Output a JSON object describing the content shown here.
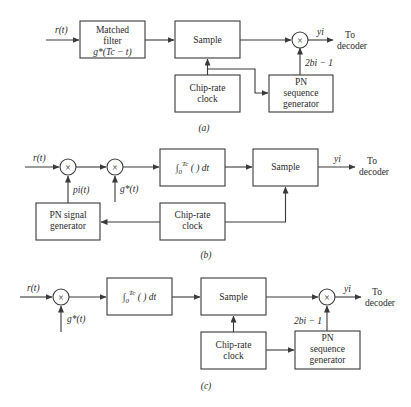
{
  "figure": {
    "panels": [
      {
        "id": "a",
        "caption": "(a)",
        "input_label": "r(t)",
        "matched_filter": {
          "line1": "Matched",
          "line2": "filter",
          "line3": "g*(Tc − t)"
        },
        "sample": "Sample",
        "clock": {
          "line1": "Chip-rate",
          "line2": "clock"
        },
        "pn_seq": {
          "line1": "PN",
          "line2": "sequence",
          "line3": "generator"
        },
        "pn_output_label": "2bi − 1",
        "multiplier_symbol": "×",
        "output_label": "yi",
        "dest": {
          "line1": "To",
          "line2": "decoder"
        }
      },
      {
        "id": "b",
        "caption": "(b)",
        "input_label": "r(t)",
        "multiplier_symbol": "×",
        "pn_signal_label": "pi(t)",
        "g_label": "g*(t)",
        "integrator": "∫₀^Tc ( ) dt",
        "sample": "Sample",
        "pn_signal_gen": {
          "line1": "PN signal",
          "line2": "generator"
        },
        "clock": {
          "line1": "Chip-rate",
          "line2": "clock"
        },
        "output_label": "yi",
        "dest": {
          "line1": "To",
          "line2": "decoder"
        }
      },
      {
        "id": "c",
        "caption": "(c)",
        "input_label": "r(t)",
        "multiplier_symbol": "×",
        "g_label": "g*(t)",
        "integrator": "∫₀^Tc ( ) dt",
        "sample": "Sample",
        "clock": {
          "line1": "Chip-rate",
          "line2": "clock"
        },
        "pn_seq": {
          "line1": "PN",
          "line2": "sequence",
          "line3": "generator"
        },
        "pn_output_label": "2bi − 1",
        "output_label": "yi",
        "dest": {
          "line1": "To",
          "line2": "decoder"
        }
      }
    ]
  }
}
